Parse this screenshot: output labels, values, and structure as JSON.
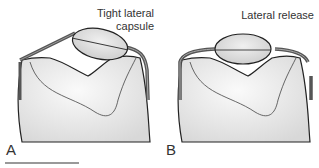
{
  "panels": [
    {
      "letter": "A",
      "title_line1": "Tight lateral",
      "title_line2": "capsule"
    },
    {
      "letter": "B",
      "title_line1": "Lateral release",
      "title_line2": ""
    }
  ]
}
